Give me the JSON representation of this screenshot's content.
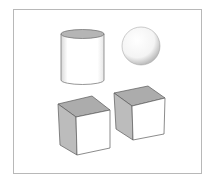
{
  "scene": {
    "title": "",
    "background": "#ffffff",
    "frame_color": "#b8b8b8",
    "shapes": [
      {
        "name": "cylinder",
        "top_fill": "#b5b5b5",
        "side_fill": "#ffffff",
        "edge": "#6a6a6a"
      },
      {
        "name": "sphere",
        "fill": "#ffffff",
        "shade": "#c8c8c8"
      },
      {
        "name": "cube-left",
        "top_fill": "#acacac",
        "left_fill": "#bcbcbc",
        "front_fill": "#ffffff",
        "edge": "#5a5a5a"
      },
      {
        "name": "cube-right",
        "top_fill": "#acacac",
        "left_fill": "#bcbcbc",
        "front_fill": "#ffffff",
        "edge": "#5a5a5a"
      }
    ]
  }
}
